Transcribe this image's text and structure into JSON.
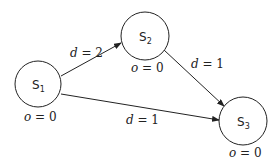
{
  "nodes": [
    {
      "id": "S1",
      "label": "S",
      "sub": "1",
      "cx": 38,
      "cy": 84,
      "r": 23,
      "annotation": {
        "var": "o",
        "eq": " = 0",
        "x": 24,
        "y": 121
      }
    },
    {
      "id": "S2",
      "label": "S",
      "sub": "2",
      "cx": 145,
      "cy": 36,
      "r": 24,
      "annotation": {
        "var": "o",
        "eq": " = 0",
        "x": 131,
        "y": 72
      }
    },
    {
      "id": "S3",
      "label": "S",
      "sub": "3",
      "cx": 243,
      "cy": 121,
      "r": 24,
      "annotation": {
        "var": "o",
        "eq": " = 0",
        "x": 229,
        "y": 157
      }
    }
  ],
  "edges": [
    {
      "from": "S1",
      "to": "S2",
      "label": {
        "var": "d",
        "eq": " = 2",
        "x": 70,
        "y": 57
      }
    },
    {
      "from": "S2",
      "to": "S3",
      "label": {
        "var": "d",
        "eq": " = 1",
        "x": 191,
        "y": 68
      }
    },
    {
      "from": "S1",
      "to": "S3",
      "label": {
        "var": "d",
        "eq": " = 1",
        "x": 126,
        "y": 124
      }
    }
  ],
  "colors": {
    "stroke": "#222222",
    "background": "#ffffff"
  }
}
